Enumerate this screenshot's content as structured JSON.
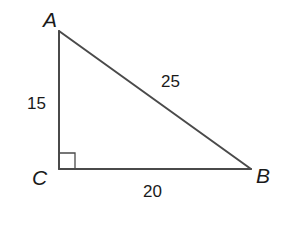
{
  "diagram": {
    "type": "right-triangle",
    "vertices": {
      "A": {
        "label": "A",
        "x": 59,
        "y": 31
      },
      "B": {
        "label": "B",
        "x": 251,
        "y": 169
      },
      "C": {
        "label": "C",
        "x": 59,
        "y": 169
      }
    },
    "sides": {
      "AC": {
        "label": "15"
      },
      "AB": {
        "label": "25"
      },
      "CB": {
        "label": "20"
      }
    },
    "right_angle_at": "C",
    "colors": {
      "line": "#4a4a4a",
      "text": "#1a1a1a",
      "background": "#ffffff"
    }
  }
}
